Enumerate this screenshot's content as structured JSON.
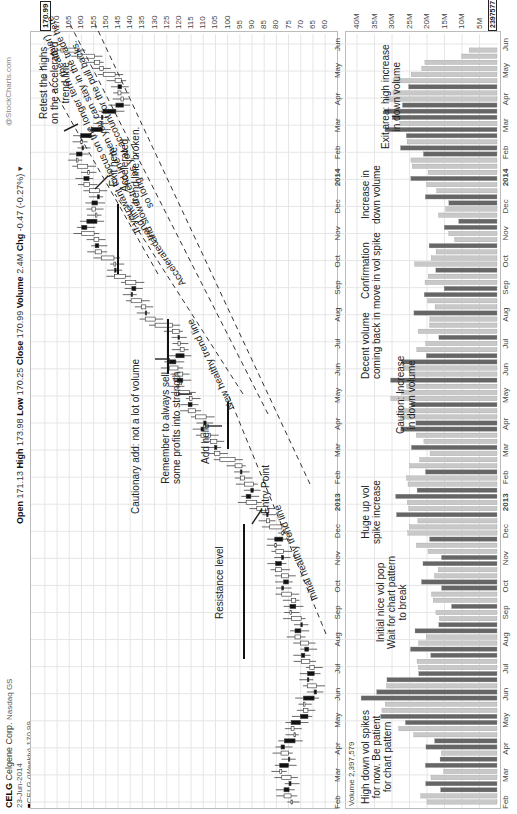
{
  "header": {
    "symbol": "CELG",
    "company": "Celgene Corp.",
    "exchange": "Nasdaq GS",
    "date": "23-Jun-2014",
    "series_label": "CELG (Weekly) 170.99",
    "watermark": "@StockCharts.com",
    "open_label": "Open",
    "open": "171.13",
    "high_label": "High",
    "high": "173.98",
    "low_label": "Low",
    "low": "170.25",
    "close_label": "Close",
    "close": "170.99",
    "volume_label": "Volume",
    "volume": "2.4M",
    "chg_label": "Chg",
    "chg": "-0.47 (-0.27%)"
  },
  "price_axis": {
    "ticks": [
      "175",
      "170",
      "165",
      "160",
      "155",
      "150",
      "145",
      "140",
      "135",
      "130",
      "125",
      "120",
      "115",
      "110",
      "105",
      "100",
      "95",
      "90",
      "85",
      "80",
      "75",
      "70",
      "65",
      "60"
    ],
    "last_value": "170.99"
  },
  "volume_panel": {
    "label": "Volume 2,397,579",
    "ticks": [
      "40M",
      "35M",
      "30M",
      "25M",
      "20M",
      "15M",
      "10M",
      "5M"
    ],
    "last_value": "2397577"
  },
  "x_axis": {
    "labels": [
      "Feb",
      "Mar",
      "Apr",
      "May",
      "Jun",
      "Jul",
      "Aug",
      "Sep",
      "Oct",
      "Nov",
      "Dec",
      "2013",
      "Feb",
      "Mar",
      "Apr",
      "May",
      "Jun",
      "Jul",
      "Aug",
      "Sep",
      "Oct",
      "Nov",
      "Dec",
      "2014",
      "Feb",
      "Mar",
      "Apr",
      "May",
      "Jun"
    ]
  },
  "annotations": {
    "resistance": "Resistance level",
    "entry": "Entry Point",
    "initial_trend": "Initial healthy trend line",
    "add_here": "Add here",
    "remember_1": "Remember to always sell",
    "remember_2": "some profits into strength",
    "cautionary": "Cautionary add: not a lot of volume",
    "new_trend": "New healthy trend line",
    "accel_trend": "Accelerated trend line",
    "exit_1": "Exit here.",
    "exit_2": "Accelerated",
    "exit_3": "trend line broken.",
    "retest_1": "Retest the highs",
    "retest_2": "on the accelerated",
    "retest_3": "trend line",
    "longer_1": "If you want to focus on the longer term (healthier)",
    "longer_2": "and slower trend line then you can stay in the trade here",
    "longer_3": "so long as you account for the pull backs.",
    "vol_high_1": "High down vol spikes",
    "vol_high_2": "for now. Be patient",
    "vol_high_3": "for chart pattern",
    "vol_initial_1": "Initial nice vol pop",
    "vol_initial_2": "Wait for chart pattern",
    "vol_initial_3": "to break",
    "vol_huge_1": "Huge up vol",
    "vol_huge_2": "spike increase",
    "vol_caution_1": "Caution: Increase",
    "vol_caution_2": "in down volume",
    "vol_decent_1": "Decent volume",
    "vol_decent_2": "coming back in",
    "vol_confirm_1": "Confirmation",
    "vol_confirm_2": "move in vol spike",
    "vol_incdown_1": "Increase in",
    "vol_incdown_2": "down volume",
    "vol_exit_1": "Exit area: high increase",
    "vol_exit_2": "in down volume"
  },
  "chart_data": {
    "type": "candlestick",
    "xlabel": "",
    "ylabel": "Price",
    "ylim": [
      58,
      177
    ],
    "grid": true,
    "x": [
      "2012-02",
      "2012-03",
      "2012-04",
      "2012-05",
      "2012-06",
      "2012-07",
      "2012-08",
      "2012-09",
      "2012-10",
      "2012-11",
      "2012-12",
      "2013-01",
      "2013-02",
      "2013-03",
      "2013-04",
      "2013-05",
      "2013-06",
      "2013-07",
      "2013-08",
      "2013-09",
      "2013-10",
      "2013-11",
      "2013-12",
      "2014-01",
      "2014-02",
      "2014-03",
      "2014-04",
      "2014-05",
      "2014-06"
    ],
    "series": [
      {
        "name": "Close (approx monthly)",
        "values": [
          74,
          77,
          76,
          70,
          65,
          67,
          70,
          73,
          77,
          79,
          79,
          90,
          93,
          106,
          111,
          118,
          122,
          118,
          135,
          140,
          150,
          158,
          153,
          158,
          162,
          152,
          142,
          150,
          171
        ]
      },
      {
        "name": "Volume (approx M)",
        "values": [
          20,
          18,
          17,
          30,
          37,
          21,
          23,
          15,
          19,
          18,
          24,
          27,
          24,
          21,
          26,
          28,
          27,
          19,
          21,
          18,
          21,
          13,
          15,
          22,
          24,
          30,
          30,
          25,
          2.4
        ]
      }
    ],
    "last": {
      "open": 171.13,
      "high": 173.98,
      "low": 170.25,
      "close": 170.99,
      "volume": 2397577
    }
  }
}
